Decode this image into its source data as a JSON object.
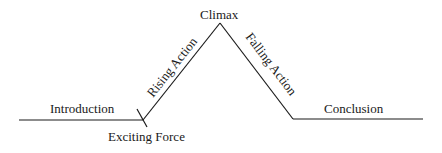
{
  "diagram": {
    "type": "plot-structure (Freytag's pyramid)",
    "line_color": "#1a1a1a",
    "labels": {
      "introduction": "Introduction",
      "exciting_force": "Exciting Force",
      "rising_action": "Rising Action",
      "climax": "Climax",
      "falling_action": "Falling Action",
      "conclusion": "Conclusion"
    }
  }
}
